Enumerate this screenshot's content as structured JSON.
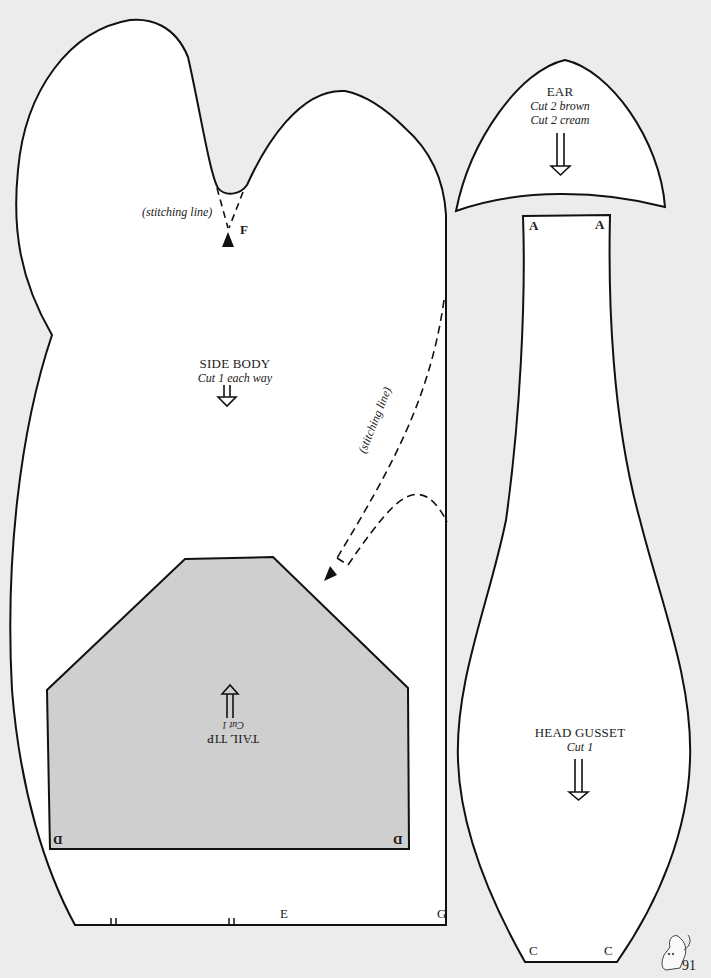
{
  "page": {
    "number": "91",
    "background_color": "#ececec",
    "paper_color": "#ffffff",
    "shaded_piece_color": "#cfcfcf",
    "line_color": "#111111"
  },
  "pieces": {
    "side_body": {
      "title": "SIDE BODY",
      "instruction": "Cut 1 each way",
      "stitch_label_top": "(stitching line)",
      "stitch_label_side": "(stitching line)",
      "marks": {
        "f": "F",
        "e": "E",
        "g": "G"
      }
    },
    "tail_tip": {
      "title": "TAIL TIP",
      "instruction": "Cut 1",
      "marks": {
        "d_left": "D",
        "d_right": "D"
      }
    },
    "ear": {
      "title": "EAR",
      "instruction_1": "Cut 2 brown",
      "instruction_2": "Cut 2 cream"
    },
    "head_gusset": {
      "title": "HEAD GUSSET",
      "instruction": "Cut 1",
      "marks": {
        "a_left": "A",
        "a_right": "A",
        "c_left": "C",
        "c_right": "C"
      }
    }
  },
  "decorations": {
    "footer_icon": "kitten-icon"
  }
}
